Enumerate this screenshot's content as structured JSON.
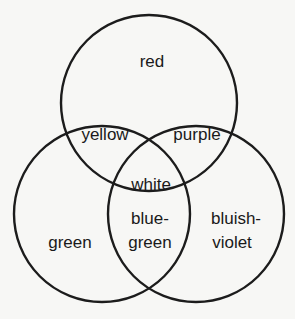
{
  "diagram": {
    "type": "venn",
    "circles": [
      {
        "name": "red",
        "cx": 149,
        "cy": 103,
        "r": 88
      },
      {
        "name": "green",
        "cx": 102,
        "cy": 214,
        "r": 88
      },
      {
        "name": "bluish-violet",
        "cx": 196,
        "cy": 214,
        "r": 88
      }
    ],
    "regions": {
      "red": "red",
      "yellow": "yellow",
      "purple": "purple",
      "white": "white",
      "blue_green_1": "blue-",
      "blue_green_2": "green",
      "green": "green",
      "bluish_violet_1": "bluish-",
      "bluish_violet_2": "violet"
    },
    "stroke_color": "#1c1c1c",
    "background": "#f7f7f5"
  }
}
